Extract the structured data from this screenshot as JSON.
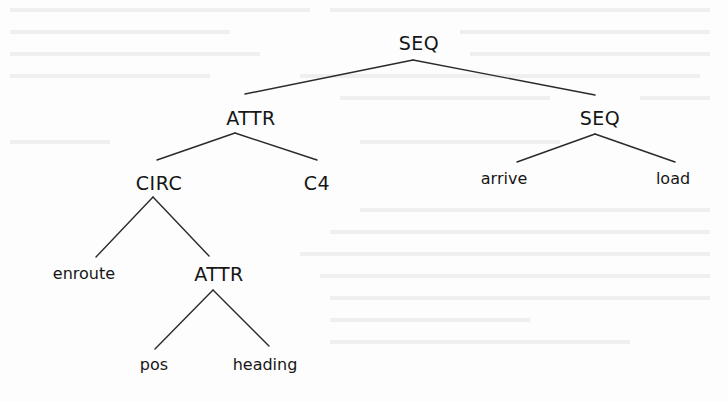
{
  "diagram": {
    "type": "tree",
    "background_color": "#fdfdfd",
    "line_color": "#2a2a2a",
    "text_color": "#161616",
    "nodes": [
      {
        "id": "n0",
        "label": "SEQ",
        "kind": "inner",
        "x": 419,
        "y": 53,
        "parent": null
      },
      {
        "id": "n1",
        "label": "ATTR",
        "kind": "inner",
        "x": 251,
        "y": 128,
        "parent": "n0"
      },
      {
        "id": "n2",
        "label": "SEQ",
        "kind": "inner",
        "x": 600,
        "y": 128,
        "parent": "n0"
      },
      {
        "id": "n3",
        "label": "CIRC",
        "kind": "inner",
        "x": 159,
        "y": 193,
        "parent": "n1"
      },
      {
        "id": "n4",
        "label": "C4",
        "kind": "inner",
        "x": 317,
        "y": 193,
        "parent": "n1"
      },
      {
        "id": "n5",
        "label": "arrive",
        "kind": "leaf",
        "x": 504,
        "y": 187,
        "parent": "n2"
      },
      {
        "id": "n6",
        "label": "load",
        "kind": "leaf",
        "x": 673,
        "y": 187,
        "parent": "n2"
      },
      {
        "id": "n7",
        "label": "enroute",
        "kind": "leaf",
        "x": 84,
        "y": 282,
        "parent": "n3"
      },
      {
        "id": "n8",
        "label": "ATTR",
        "kind": "inner",
        "x": 219,
        "y": 284,
        "parent": "n3"
      },
      {
        "id": "n9",
        "label": "pos",
        "kind": "leaf",
        "x": 154,
        "y": 373,
        "parent": "n8"
      },
      {
        "id": "n10",
        "label": "heading",
        "kind": "leaf",
        "x": 265,
        "y": 373,
        "parent": "n8"
      }
    ],
    "edges": [
      {
        "from": "n0",
        "to": "n1",
        "x1": 413,
        "y1": 60,
        "x2": 245,
        "y2": 94
      },
      {
        "from": "n0",
        "to": "n2",
        "x1": 413,
        "y1": 60,
        "x2": 595,
        "y2": 95
      },
      {
        "from": "n1",
        "to": "n3",
        "x1": 235,
        "y1": 133,
        "x2": 157,
        "y2": 160
      },
      {
        "from": "n1",
        "to": "n4",
        "x1": 235,
        "y1": 133,
        "x2": 317,
        "y2": 160
      },
      {
        "from": "n2",
        "to": "n5",
        "x1": 595,
        "y1": 134,
        "x2": 517,
        "y2": 162
      },
      {
        "from": "n2",
        "to": "n6",
        "x1": 595,
        "y1": 134,
        "x2": 675,
        "y2": 162
      },
      {
        "from": "n3",
        "to": "n7",
        "x1": 153,
        "y1": 197,
        "x2": 96,
        "y2": 257
      },
      {
        "from": "n3",
        "to": "n8",
        "x1": 153,
        "y1": 197,
        "x2": 209,
        "y2": 256
      },
      {
        "from": "n8",
        "to": "n9",
        "x1": 213,
        "y1": 290,
        "x2": 155,
        "y2": 349
      },
      {
        "from": "n8",
        "to": "n10",
        "x1": 213,
        "y1": 290,
        "x2": 269,
        "y2": 346
      }
    ]
  }
}
